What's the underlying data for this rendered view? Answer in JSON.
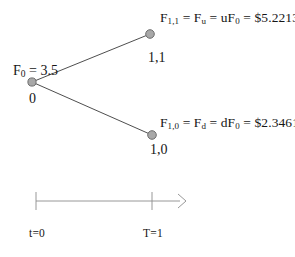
{
  "diagram": {
    "type": "one-period-binomial-tree",
    "background_color": "#ffffff",
    "line_color": "#333333",
    "node_fill_color": "#a8a8a8",
    "node_stroke_color": "#6e6e6e",
    "text_color": "#161616",
    "nodes": [
      {
        "id": "root",
        "node_label": "0",
        "value_label_prefix": "F",
        "value_label_subscript": "0",
        "value_label_rest": " = 3.5",
        "x": 32,
        "y": 82
      },
      {
        "id": "up",
        "node_label": "1,1",
        "x": 150,
        "y": 34
      },
      {
        "id": "down",
        "node_label": "1,0",
        "x": 152,
        "y": 135
      }
    ],
    "up_formula": {
      "f1": "F",
      "f1_sub": "1,1",
      "eq1": " = F",
      "f2_sub": "u",
      "eq2": " = uF",
      "f3_sub": "0",
      "eq3": " = $5.2213",
      "full_text": "F1,1 = Fu = uF0 = $5.2213",
      "value": "$5.2213"
    },
    "down_formula": {
      "f1": "F",
      "f1_sub": "1,0",
      "eq1": " = F",
      "f2_sub": "d",
      "eq2": " = dF",
      "f3_sub": "0",
      "eq3": " = $2.3461",
      "full_text": "F1,0 = Fd = dF0 = $2.3461",
      "value": "$2.3461"
    },
    "timeline": {
      "start_label": "t=0",
      "end_label": "T=1",
      "axis_y": 201,
      "left_tick_x": 36,
      "right_tick_x": 152,
      "arrow_end_x": 186,
      "tick_half_height": 9
    }
  }
}
